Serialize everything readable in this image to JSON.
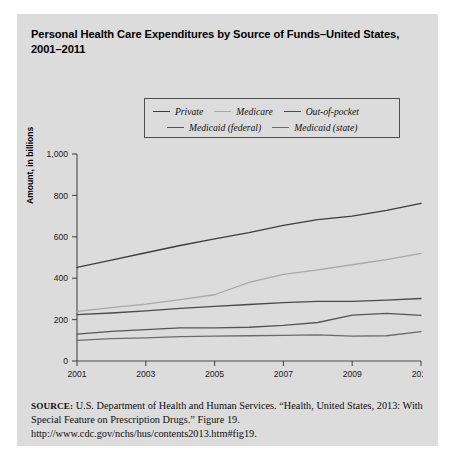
{
  "figure": {
    "title": "Personal Health Care Expenditures by Source of Funds–United States, 2001–2011",
    "source_prefix": "SOURCE:",
    "source_text": " U.S. Department of Health and Human Services. “Health, United States, 2013: With Special Feature on Prescription Drugs.” Figure 19. http://www.cdc.gov/nchs/hus/contents2013.htm#fig19.",
    "panel_color": "#dcdcdc",
    "page_color": "#ffffff"
  },
  "legend": {
    "items": [
      {
        "label": "Private",
        "color": "#3d3d3d"
      },
      {
        "label": "Medicare",
        "color": "#a8a8a8"
      },
      {
        "label": "Out-of-pocket",
        "color": "#4a4a4a"
      },
      {
        "label": "Medicaid (federal)",
        "color": "#565656"
      },
      {
        "label": "Medicaid (state)",
        "color": "#6b6b6b"
      }
    ]
  },
  "chart_data": {
    "type": "line",
    "title": "Personal Health Care Expenditures by Source of Funds–United States, 2001–2011",
    "xlabel": "",
    "ylabel": "Amount, in billions",
    "x": [
      2001,
      2002,
      2003,
      2004,
      2005,
      2006,
      2007,
      2008,
      2009,
      2010,
      2011
    ],
    "xlim": [
      2001,
      2011
    ],
    "ylim": [
      0,
      1000
    ],
    "xticks": [
      2001,
      2003,
      2005,
      2007,
      2009,
      2011
    ],
    "xtick_labels": [
      "2001",
      "2003",
      "2005",
      "2007",
      "2009",
      "2011"
    ],
    "yticks": [
      0,
      200,
      400,
      600,
      800,
      1000
    ],
    "ytick_labels": [
      "0",
      "200",
      "400",
      "600",
      "800",
      "1,000"
    ],
    "grid": false,
    "legend_position": "top-center",
    "series": [
      {
        "name": "Private",
        "color": "#3d3d3d",
        "values": [
          452,
          487,
          523,
          558,
          590,
          620,
          655,
          683,
          700,
          728,
          762
        ]
      },
      {
        "name": "Medicare",
        "color": "#a8a8a8",
        "values": [
          240,
          258,
          275,
          296,
          320,
          380,
          418,
          440,
          465,
          490,
          520
        ]
      },
      {
        "name": "Out-of-pocket",
        "color": "#4a4a4a",
        "values": [
          224,
          232,
          242,
          254,
          264,
          273,
          282,
          288,
          288,
          294,
          302
        ]
      },
      {
        "name": "Medicaid (federal)",
        "color": "#565656",
        "values": [
          130,
          143,
          152,
          160,
          160,
          163,
          172,
          186,
          222,
          230,
          220
        ]
      },
      {
        "name": "Medicaid (state)",
        "color": "#6b6b6b",
        "values": [
          100,
          108,
          112,
          118,
          120,
          122,
          124,
          126,
          120,
          122,
          142
        ]
      }
    ]
  }
}
